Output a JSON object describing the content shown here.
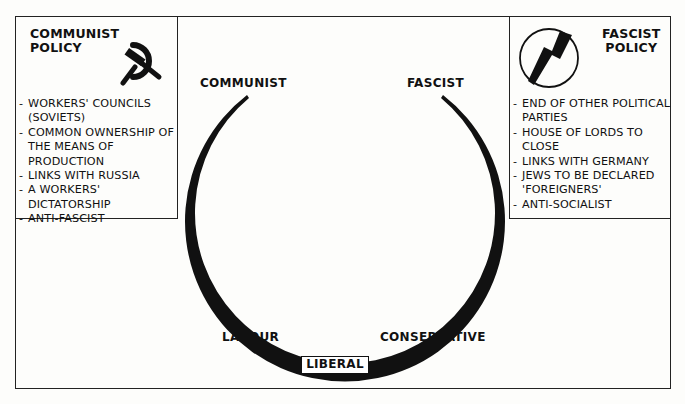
{
  "diagram": {
    "type": "political-spectrum-horseshoe",
    "communist_panel": {
      "title_line1": "COMMUNIST",
      "title_line2": "POLICY",
      "icon": "hammer-and-sickle-icon",
      "items": [
        "WORKERS' COUNCILS (SOVIETS)",
        "COMMON OWNERSHIP OF THE MEANS OF PRODUCTION",
        "LINKS WITH RUSSIA",
        "A WORKERS' DICTATORSHIP",
        "ANTI-FASCIST"
      ]
    },
    "fascist_panel": {
      "title_line1": "FASCIST",
      "title_line2": "POLICY",
      "icon": "flash-and-circle-icon",
      "items": [
        "END OF OTHER POLITICAL PARTIES",
        "HOUSE OF LORDS TO CLOSE",
        "LINKS WITH GERMANY",
        "JEWS TO BE DECLARED 'FOREIGNERS'",
        "ANTI-SOCIALIST"
      ]
    },
    "spectrum_labels": {
      "communist": "COMMUNIST",
      "fascist": "FASCIST",
      "labour": "LABOUR",
      "conservative": "CONSERVATIVE",
      "liberal": "LIBERAL"
    },
    "colors": {
      "ink": "#111111",
      "paper": "#fdfdfb"
    }
  }
}
